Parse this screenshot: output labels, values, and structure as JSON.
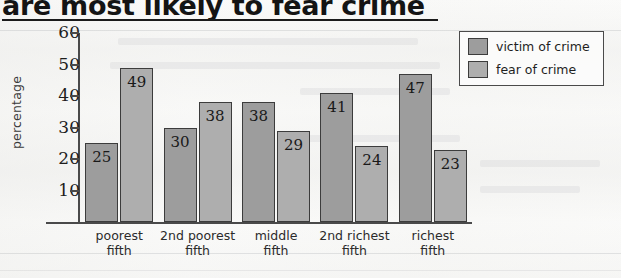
{
  "chart_data": {
    "type": "bar",
    "title": "are most likely to fear crime",
    "xlabel": "",
    "ylabel": "percentage",
    "ylim": [
      0,
      60
    ],
    "yticks": [
      10,
      20,
      30,
      40,
      50,
      60
    ],
    "grid": false,
    "legend_position": "top-right",
    "categories": [
      "poorest fifth",
      "2nd poorest fifth",
      "middle fifth",
      "2nd richest fifth",
      "richest fifth"
    ],
    "category_lines": [
      {
        "line1": "poorest",
        "line2": "fifth"
      },
      {
        "line1": "2nd poorest",
        "line2": "fifth"
      },
      {
        "line1": "middle",
        "line2": "fifth"
      },
      {
        "line1": "2nd richest",
        "line2": "fifth"
      },
      {
        "line1": "richest",
        "line2": "fifth"
      }
    ],
    "series": [
      {
        "name": "victim of crime",
        "color": "#9d9d9d",
        "values": [
          25,
          30,
          38,
          41,
          47
        ]
      },
      {
        "name": "fear of crime",
        "color": "#aeaeae",
        "values": [
          49,
          38,
          29,
          24,
          23
        ]
      }
    ]
  },
  "legend": {
    "items": [
      {
        "label": "victim of crime"
      },
      {
        "label": "fear of crime"
      }
    ]
  },
  "axis": {
    "y_title": "percentage",
    "y_ticks": [
      "60",
      "50",
      "40",
      "30",
      "20",
      "10"
    ]
  }
}
